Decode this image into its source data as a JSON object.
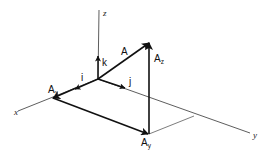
{
  "diagram": {
    "axes": {
      "x": "x",
      "y": "y",
      "z": "z"
    },
    "unit_vectors": {
      "i": "i",
      "j": "j",
      "k": "k"
    },
    "vectors": {
      "A": "A",
      "Ax_main": "A",
      "Ax_sub": "x",
      "Ay_main": "A",
      "Ay_sub": "y",
      "Az_main": "A",
      "Az_sub": "z"
    }
  }
}
